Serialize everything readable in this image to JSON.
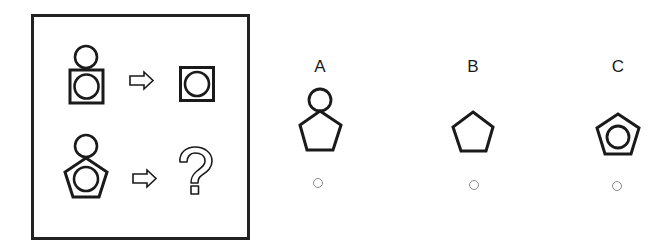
{
  "puzzle": {
    "type": "figure-analogy",
    "question_box": {
      "rows": [
        {
          "source": "circle-above-square-containing-circle",
          "arrow": "right-arrow",
          "result": "square-containing-circle"
        },
        {
          "source": "circle-above-pentagon-containing-circle",
          "arrow": "right-arrow",
          "result": "question-mark"
        }
      ],
      "unknown_symbol": "?"
    },
    "options": [
      {
        "label": "A",
        "figure": "circle-above-pentagon",
        "selected": false
      },
      {
        "label": "B",
        "figure": "pentagon",
        "selected": false
      },
      {
        "label": "C",
        "figure": "pentagon-containing-circle",
        "selected": false
      }
    ]
  },
  "colors": {
    "stroke": "#1a1a1a",
    "frame": "#222222",
    "radio_border": "#8a8a8a",
    "background": "#ffffff"
  }
}
